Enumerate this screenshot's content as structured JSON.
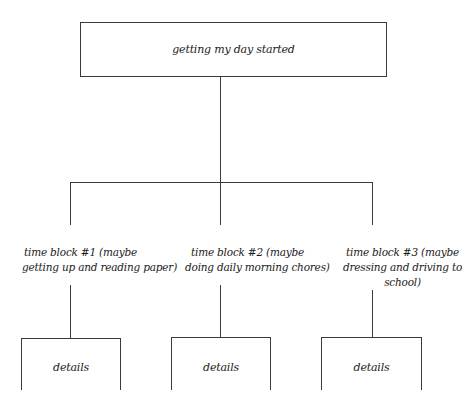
{
  "diagram": {
    "type": "hierarchy-tree",
    "root": {
      "label": "getting my day started"
    },
    "children": [
      {
        "line1": "time block #1 (maybe",
        "line2": "getting up and reading paper)",
        "line3": "",
        "detail_label": "details"
      },
      {
        "line1": "time block #2 (maybe",
        "line2": "doing daily morning chores)",
        "line3": "",
        "detail_label": "details"
      },
      {
        "line1": "time block #3 (maybe",
        "line2": "dressing and driving to",
        "line3": "school)",
        "detail_label": "details"
      }
    ],
    "colors": {
      "line": "#3a3a3a",
      "text": "#1a1a1a",
      "background": "#ffffff"
    }
  }
}
